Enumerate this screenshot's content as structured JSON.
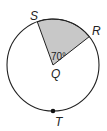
{
  "diagram": {
    "type": "circle-sector",
    "center": {
      "label": "Q",
      "x": 53,
      "y": 65
    },
    "radius": 46,
    "points": [
      {
        "label": "S",
        "x": 37,
        "y": 22
      },
      {
        "label": "R",
        "x": 89,
        "y": 35
      },
      {
        "label": "T",
        "x": 53,
        "y": 111
      }
    ],
    "sector": {
      "from": "S",
      "to": "R",
      "vertex": "Q",
      "angle_label": "70°",
      "fill": "#c8c8c8"
    },
    "stroke_color": "#222222"
  }
}
